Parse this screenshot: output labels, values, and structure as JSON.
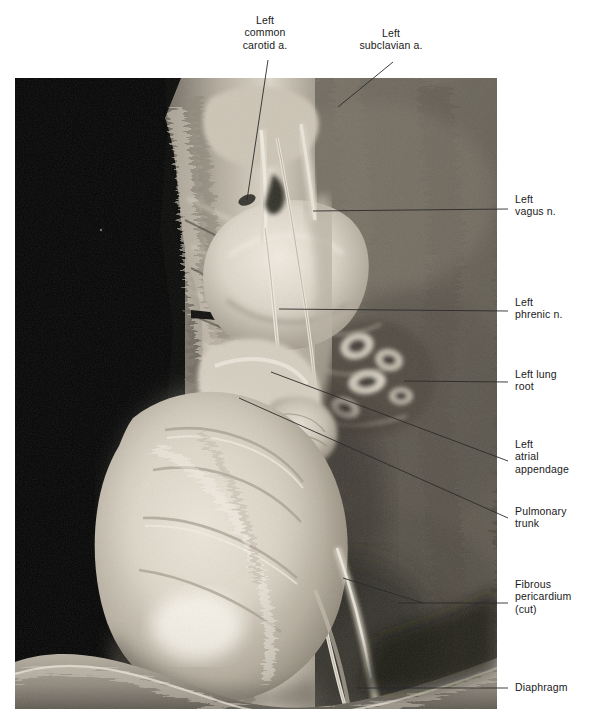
{
  "plate": {
    "kind": "anatomical-dissection-photograph",
    "subject": "Left side of the mediastinum, thorax dissection",
    "photo": {
      "left": 15,
      "top": 78,
      "width": 482,
      "height": 631,
      "background_color": "#000000",
      "tissue_tone_light": "#d8d2c6",
      "tissue_tone_mid": "#9a9387",
      "tissue_tone_dark": "#3a3630"
    }
  },
  "labels": [
    {
      "id": "left-common-carotid-artery",
      "text": "Left\ncommon\ncarotid a.",
      "align": "center",
      "x": 222,
      "y": 14,
      "width": 86,
      "leader": {
        "x1": 268,
        "y1": 60,
        "x2": 247,
        "y2": 200
      }
    },
    {
      "id": "left-subclavian-artery",
      "text": "Left\nsubclavian a.",
      "align": "center",
      "x": 345,
      "y": 27,
      "width": 92,
      "leader": {
        "x1": 393,
        "y1": 62,
        "x2": 338,
        "y2": 107
      }
    },
    {
      "id": "left-vagus-nerve",
      "text": "Left\nvagus n.",
      "align": "left",
      "x": 515,
      "y": 193,
      "width": 78,
      "leader": {
        "x1": 508,
        "y1": 209,
        "x2": 313,
        "y2": 211
      }
    },
    {
      "id": "left-phrenic-nerve",
      "text": "Left\nphrenic n.",
      "align": "left",
      "x": 515,
      "y": 296,
      "width": 78,
      "leader": {
        "x1": 508,
        "y1": 311,
        "x2": 279,
        "y2": 309
      }
    },
    {
      "id": "left-lung-root",
      "text": "Left lung\nroot",
      "align": "left",
      "x": 515,
      "y": 368,
      "width": 78,
      "leader": {
        "x1": 508,
        "y1": 382,
        "x2": 404,
        "y2": 381
      }
    },
    {
      "id": "left-atrial-appendage",
      "text": "Left\natrial\nappendage",
      "align": "left",
      "x": 515,
      "y": 438,
      "width": 80,
      "leader": {
        "x1": 508,
        "y1": 461,
        "x2": 271,
        "y2": 372
      }
    },
    {
      "id": "pulmonary-trunk",
      "text": "Pulmonary\ntrunk",
      "align": "left",
      "x": 515,
      "y": 505,
      "width": 80,
      "leader": {
        "x1": 508,
        "y1": 518,
        "x2": 239,
        "y2": 398
      }
    },
    {
      "id": "fibrous-pericardium-cut",
      "text": "Fibrous\npericardium\n(cut)",
      "align": "left",
      "x": 515,
      "y": 578,
      "width": 84,
      "leader": {
        "x1": 508,
        "y1": 603,
        "x2": 398,
        "y2": 603
      },
      "leader2": {
        "x1": 423,
        "y1": 603,
        "x2": 343,
        "y2": 578
      }
    },
    {
      "id": "diaphragm",
      "text": "Diaphragm",
      "align": "left",
      "x": 515,
      "y": 681,
      "width": 80,
      "leader": {
        "x1": 508,
        "y1": 688,
        "x2": 357,
        "y2": 688
      }
    }
  ]
}
